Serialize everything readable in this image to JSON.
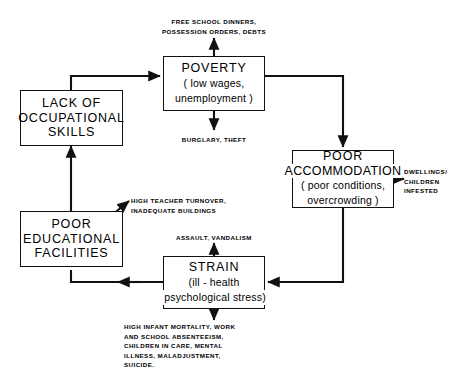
{
  "diagram": {
    "stroke_color": "#111111",
    "background_color": "#ffffff",
    "nodes": [
      {
        "id": "poverty",
        "title": "POVERTY",
        "sub_line1": "( low wages,",
        "sub_line2": "unemployment )"
      },
      {
        "id": "lack_of_occupational_skills",
        "title_line1": "LACK  OF",
        "title_line2": "OCCUPATIONAL",
        "title_line3": "SKILLS"
      },
      {
        "id": "poor_accommodation",
        "title_line1": "POOR",
        "title_line2": "ACCOMMODATION",
        "sub_line1": "( poor conditions,",
        "sub_line2": "overcrowding )"
      },
      {
        "id": "poor_educational_facilities",
        "title_line1": "POOR",
        "title_line2": "EDUCATIONAL",
        "title_line3": "FACILITIES"
      },
      {
        "id": "strain",
        "title": "STRAIN",
        "sub_line1": "(ill - health",
        "sub_line2": "psychological stress)"
      }
    ],
    "annotations": {
      "poverty_up": {
        "line1": "FREE SCHOOL DINNERS,",
        "line2": "POSSESSION ORDERS, DEBTS"
      },
      "poverty_down": {
        "line1": "BURGLARY, THEFT"
      },
      "accommodation_right": {
        "line1": "DWELLINGS/",
        "line2": "CHILDREN",
        "line3": "INFESTED"
      },
      "education_diagonal": {
        "line1": "HIGH  TEACHER  TURNOVER,",
        "line2": "INADEQUATE  BUILDINGS"
      },
      "strain_up": {
        "line1": "ASSAULT, VANDALISM"
      },
      "strain_down": {
        "line1": "HIGH INFANT MORTALITY, WORK",
        "line2": "AND SCHOOL  ABSENTEEISM,",
        "line3": "CHILDREN IN CARE,  MENTAL",
        "line4": "ILLNESS,  MALADJUSTMENT,",
        "line5": "SUICIDE."
      }
    }
  }
}
